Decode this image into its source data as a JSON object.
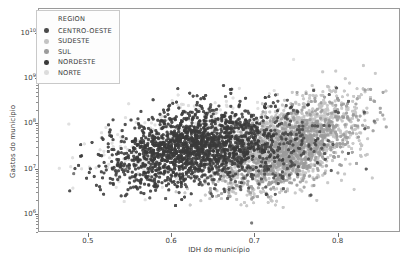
{
  "chart_data": {
    "type": "scatter",
    "title": "",
    "xlabel": "IDH do município",
    "ylabel": "Gastos do município",
    "xlim": [
      0.44,
      0.875
    ],
    "ylim_log10": [
      5.6,
      10.55
    ],
    "yscale": "log",
    "xscale": "linear",
    "grid": false,
    "xticks": [
      0.5,
      0.6,
      0.7,
      0.8
    ],
    "xticklabels": [
      "0.5",
      "0.6",
      "0.7",
      "0.8"
    ],
    "yticks_log10": [
      6,
      7,
      8,
      9,
      10
    ],
    "yticklabels": [
      "10⁶",
      "10⁷",
      "10⁸",
      "10⁹",
      "10¹⁰"
    ],
    "ytick_exponents": [
      "6",
      "7",
      "8",
      "9",
      "10"
    ],
    "ytick_mantissa": "10",
    "minor_ticks": true,
    "marker": "circle",
    "marker_size_px": 3.2,
    "legend": {
      "title": "REGION",
      "position": "upper-left-inside",
      "entries": [
        {
          "label": "CENTRO-OESTE",
          "color": "#4a4a4a"
        },
        {
          "label": "SUDESTE",
          "color": "#c3c3c3"
        },
        {
          "label": "SUL",
          "color": "#9b9b9b"
        },
        {
          "label": "NORDESTE",
          "color": "#3a3a3a"
        },
        {
          "label": "NORTE",
          "color": "#dcdcdc"
        }
      ]
    },
    "series": [
      {
        "name": "CENTRO-OESTE",
        "color": "#4a4a4a",
        "n_points": 420,
        "x_range": [
          0.52,
          0.84
        ],
        "y_log10_range": [
          6.3,
          9.9
        ],
        "x_mean": 0.702,
        "x_sd": 0.052,
        "y_log10_mean": 7.42,
        "y_log10_sd": 0.5,
        "corr": 0.42
      },
      {
        "name": "SUDESTE",
        "color": "#c3c3c3",
        "n_points": 1300,
        "x_range": [
          0.57,
          0.86
        ],
        "y_log10_range": [
          6.1,
          10.3
        ],
        "x_mean": 0.74,
        "x_sd": 0.044,
        "y_log10_mean": 7.52,
        "y_log10_sd": 0.55,
        "corr": 0.52
      },
      {
        "name": "SUL",
        "color": "#9b9b9b",
        "n_points": 900,
        "x_range": [
          0.58,
          0.86
        ],
        "y_log10_range": [
          6.3,
          9.9
        ],
        "x_mean": 0.744,
        "x_sd": 0.04,
        "y_log10_mean": 7.45,
        "y_log10_sd": 0.47,
        "corr": 0.48
      },
      {
        "name": "NORDESTE",
        "color": "#3a3a3a",
        "n_points": 1400,
        "x_range": [
          0.46,
          0.8
        ],
        "y_log10_range": [
          5.9,
          9.8
        ],
        "x_mean": 0.617,
        "x_sd": 0.048,
        "y_log10_mean": 7.48,
        "y_log10_sd": 0.44,
        "corr": 0.4
      },
      {
        "name": "NORTE",
        "color": "#dcdcdc",
        "n_points": 420,
        "x_range": [
          0.46,
          0.8
        ],
        "y_log10_range": [
          6.2,
          9.9
        ],
        "x_mean": 0.618,
        "x_sd": 0.055,
        "y_log10_mean": 7.55,
        "y_log10_sd": 0.46,
        "corr": 0.44
      }
    ],
    "annotations": [
      {
        "type": "outlier",
        "x": 0.482,
        "y_log10": 6.88
      },
      {
        "type": "outlier",
        "x": 0.545,
        "y_log10": 6.98
      },
      {
        "type": "outlier",
        "x": 0.697,
        "y_log10": 5.78
      },
      {
        "type": "outlier",
        "x": 0.845,
        "y_log10": 8.05
      }
    ]
  },
  "axes": {
    "frame_color": "#9a9a9a",
    "tick_color": "#6e6e6e",
    "text_color": "#3b3b3b"
  }
}
